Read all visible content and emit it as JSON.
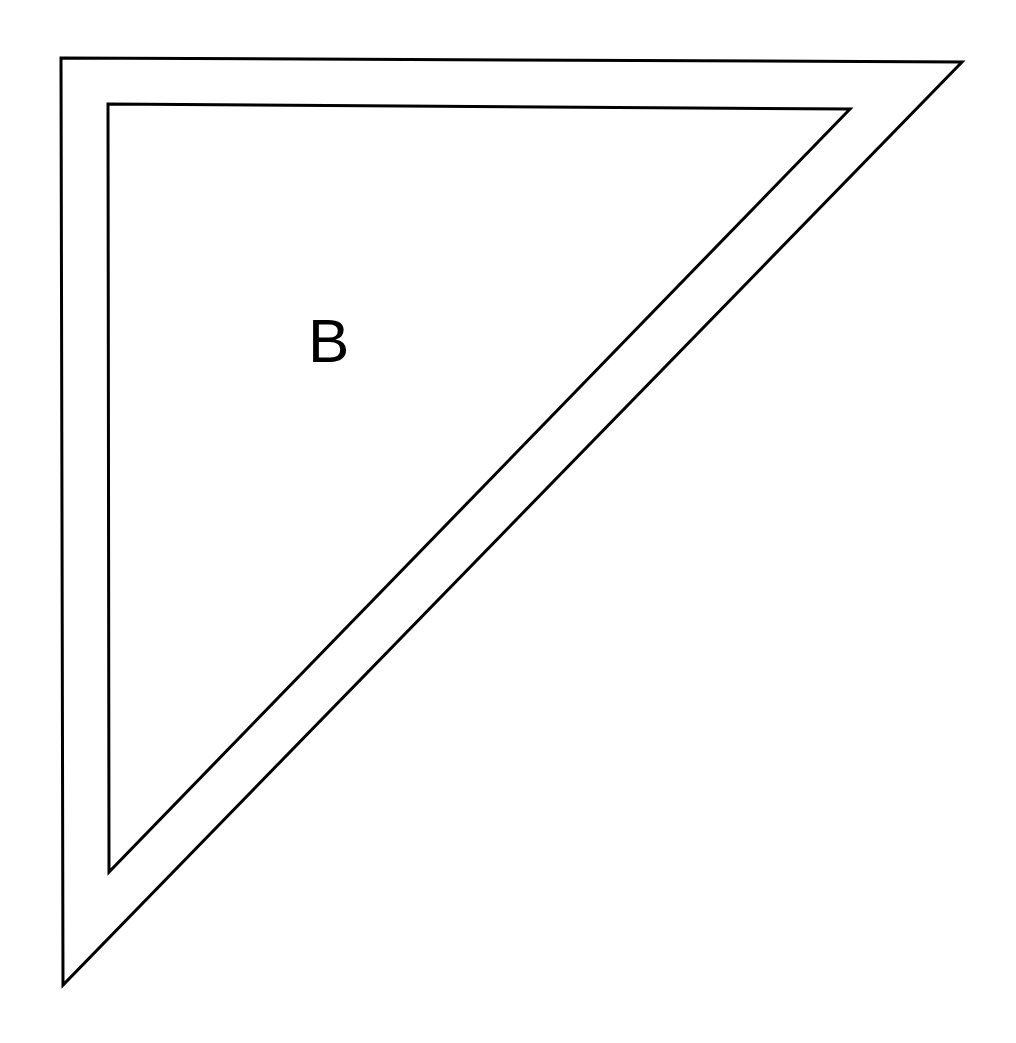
{
  "diagram": {
    "type": "nested-right-triangles",
    "stroke_color": "#000000",
    "background_color": "#ffffff",
    "outer_triangle": {
      "points": [
        [
          61,
          58
        ],
        [
          962,
          62
        ],
        [
          63,
          985
        ]
      ]
    },
    "inner_triangle": {
      "points": [
        [
          108,
          104
        ],
        [
          850,
          109
        ],
        [
          109,
          872
        ]
      ]
    },
    "label": {
      "text": "B",
      "x": 308,
      "y": 310
    }
  }
}
